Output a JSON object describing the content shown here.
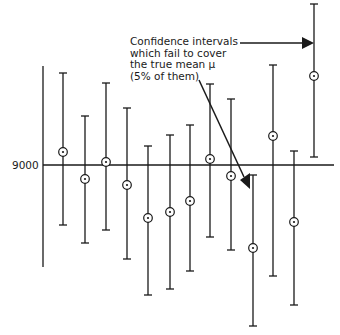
{
  "chart_data": {
    "type": "interval",
    "title": "",
    "xlabel": "",
    "ylabel": "",
    "reference_line": {
      "label": "9000",
      "value": 9000,
      "meaning": "true mean μ"
    },
    "annotation": {
      "lines": [
        "Confidence intervals",
        "which fail to cover",
        "the true mean μ",
        "(5% of them)"
      ]
    },
    "intervals": [
      {
        "index": 1,
        "lower": -60,
        "center": 13,
        "upper": 92,
        "covers": true
      },
      {
        "index": 2,
        "lower": -78,
        "center": -14,
        "upper": 49,
        "covers": true
      },
      {
        "index": 3,
        "lower": -65,
        "center": 3,
        "upper": 82,
        "covers": true
      },
      {
        "index": 4,
        "lower": -94,
        "center": -20,
        "upper": 57,
        "covers": true
      },
      {
        "index": 5,
        "lower": -130,
        "center": -53,
        "upper": 19,
        "covers": true
      },
      {
        "index": 6,
        "lower": -124,
        "center": -47,
        "upper": 30,
        "covers": true
      },
      {
        "index": 7,
        "lower": -106,
        "center": -36,
        "upper": 40,
        "covers": true
      },
      {
        "index": 8,
        "lower": -72,
        "center": 6,
        "upper": 81,
        "covers": true
      },
      {
        "index": 9,
        "lower": -85,
        "center": -11,
        "upper": 66,
        "covers": true
      },
      {
        "index": 10,
        "lower": -161,
        "center": -83,
        "upper": -10,
        "covers": false
      },
      {
        "index": 11,
        "lower": -111,
        "center": 29,
        "upper": 100,
        "covers": true
      },
      {
        "index": 12,
        "lower": -140,
        "center": -57,
        "upper": 14,
        "covers": true
      },
      {
        "index": 13,
        "lower": 8,
        "center": 89,
        "upper": 161,
        "covers": false
      }
    ],
    "units_note": "values are pixel offsets relative to the 9000 reference line (positive = above); no numeric scale shown except 9000",
    "grid": false
  },
  "pixel_layout": {
    "axis_x": 43,
    "axis_top": 66,
    "axis_bottom": 267,
    "ref_y": 165,
    "ref_x1": 43,
    "ref_x2": 334,
    "bars": [
      {
        "x": 63,
        "top": 73,
        "c": 152,
        "bot": 225
      },
      {
        "x": 85,
        "top": 116,
        "c": 179,
        "bot": 243
      },
      {
        "x": 106,
        "top": 83,
        "c": 162,
        "bot": 230
      },
      {
        "x": 127,
        "top": 108,
        "c": 185,
        "bot": 259
      },
      {
        "x": 148,
        "top": 146,
        "c": 218,
        "bot": 295
      },
      {
        "x": 170,
        "top": 135,
        "c": 212,
        "bot": 289
      },
      {
        "x": 190,
        "top": 125,
        "c": 201,
        "bot": 271
      },
      {
        "x": 210,
        "top": 84,
        "c": 159,
        "bot": 237
      },
      {
        "x": 231,
        "top": 99,
        "c": 176,
        "bot": 250
      },
      {
        "x": 253,
        "top": 175,
        "c": 248,
        "bot": 326
      },
      {
        "x": 273,
        "top": 65,
        "c": 136,
        "bot": 276
      },
      {
        "x": 294,
        "top": 151,
        "c": 222,
        "bot": 305
      },
      {
        "x": 314,
        "top": 4,
        "c": 76,
        "bot": 157
      }
    ]
  },
  "labels": {
    "annotation_text": "Confidence intervals\nwhich fail to cover\nthe true mean μ\n(5% of them)",
    "ref_label": "9000"
  },
  "colors": {
    "ink": "#1a1a1a",
    "background": "#ffffff"
  }
}
